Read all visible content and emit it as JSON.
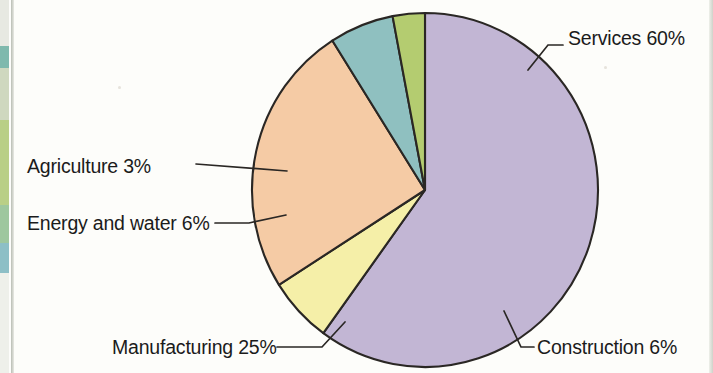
{
  "chart_data": {
    "type": "pie",
    "title": "",
    "subtitle": "",
    "xlabel": "",
    "ylabel": "",
    "legend_position": "none",
    "labels_inline": true,
    "unit": "%",
    "total": 100,
    "categories": [
      "Services",
      "Construction",
      "Manufacturing",
      "Energy and water",
      "Agriculture"
    ],
    "values": [
      60,
      6,
      25,
      6,
      3
    ],
    "colors": [
      "#c2b6d4",
      "#f5efa8",
      "#f5cba5",
      "#8fc0c0",
      "#b4cc70"
    ],
    "slices": [
      {
        "name": "Services",
        "value": 60,
        "label": "Services 60%",
        "color": "#c2b6d4",
        "start_deg": 0,
        "end_deg": 216
      },
      {
        "name": "Construction",
        "value": 6,
        "label": "Construction 6%",
        "color": "#f5efa8",
        "start_deg": 216,
        "end_deg": 237.6
      },
      {
        "name": "Manufacturing",
        "value": 25,
        "label": "Manufacturing 25%",
        "color": "#f5cba5",
        "start_deg": 237.6,
        "end_deg": 327.6
      },
      {
        "name": "Energy and water",
        "value": 6,
        "label": "Energy and water 6%",
        "color": "#8fc0c0",
        "start_deg": 327.6,
        "end_deg": 349.2
      },
      {
        "name": "Agriculture",
        "value": 3,
        "label": "Agriculture 3%",
        "color": "#b4cc70",
        "start_deg": 349.2,
        "end_deg": 360
      }
    ]
  },
  "labels": {
    "services": "Services 60%",
    "construction": "Construction 6%",
    "manufacturing": "Manufacturing 25%",
    "energy": "Energy and water 6%",
    "agriculture": "Agriculture 3%"
  },
  "style": {
    "outline": "#2a2724",
    "background": "#fdfdfa",
    "text": "#1b1b1b"
  }
}
